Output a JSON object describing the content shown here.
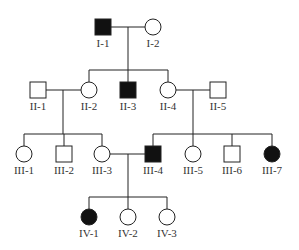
{
  "diagram": {
    "type": "pedigree",
    "colors": {
      "stroke": "#222222",
      "affected": "#111111",
      "unaffected": "#ffffff",
      "text": "#333333"
    },
    "generations": [
      "I",
      "II",
      "III",
      "IV"
    ],
    "individuals": [
      {
        "id": "I-1",
        "label": "I-1",
        "sex": "male",
        "affected": true,
        "x": 103,
        "y": 27
      },
      {
        "id": "I-2",
        "label": "I-2",
        "sex": "female",
        "affected": false,
        "x": 153,
        "y": 27
      },
      {
        "id": "II-1",
        "label": "II-1",
        "sex": "male",
        "affected": false,
        "x": 38,
        "y": 90
      },
      {
        "id": "II-2",
        "label": "II-2",
        "sex": "female",
        "affected": false,
        "x": 89,
        "y": 90
      },
      {
        "id": "II-3",
        "label": "II-3",
        "sex": "male",
        "affected": true,
        "x": 128,
        "y": 90
      },
      {
        "id": "II-4",
        "label": "II-4",
        "sex": "female",
        "affected": false,
        "x": 168,
        "y": 90
      },
      {
        "id": "II-5",
        "label": "II-5",
        "sex": "male",
        "affected": false,
        "x": 218,
        "y": 90
      },
      {
        "id": "III-1",
        "label": "III-1",
        "sex": "female",
        "affected": false,
        "x": 24,
        "y": 154
      },
      {
        "id": "III-2",
        "label": "III-2",
        "sex": "male",
        "affected": false,
        "x": 64,
        "y": 154
      },
      {
        "id": "III-3",
        "label": "III-3",
        "sex": "female",
        "affected": false,
        "x": 102,
        "y": 154
      },
      {
        "id": "III-4",
        "label": "III-4",
        "sex": "male",
        "affected": true,
        "x": 153,
        "y": 154
      },
      {
        "id": "III-5",
        "label": "III-5",
        "sex": "female",
        "affected": false,
        "x": 193,
        "y": 154
      },
      {
        "id": "III-6",
        "label": "III-6",
        "sex": "male",
        "affected": false,
        "x": 232,
        "y": 154
      },
      {
        "id": "III-7",
        "label": "III-7",
        "sex": "female",
        "affected": true,
        "x": 272,
        "y": 154
      },
      {
        "id": "IV-1",
        "label": "IV-1",
        "sex": "female",
        "affected": true,
        "x": 89,
        "y": 217
      },
      {
        "id": "IV-2",
        "label": "IV-2",
        "sex": "female",
        "affected": false,
        "x": 128,
        "y": 217
      },
      {
        "id": "IV-3",
        "label": "IV-3",
        "sex": "female",
        "affected": false,
        "x": 167,
        "y": 217
      }
    ],
    "marriages": [
      {
        "partners": [
          "I-1",
          "I-2"
        ],
        "children": [
          "II-2",
          "II-3",
          "II-4"
        ]
      },
      {
        "partners": [
          "II-1",
          "II-2"
        ],
        "children": [
          "III-1",
          "III-2",
          "III-3"
        ]
      },
      {
        "partners": [
          "II-4",
          "II-5"
        ],
        "children": [
          "III-4",
          "III-5",
          "III-6",
          "III-7"
        ]
      },
      {
        "partners": [
          "III-3",
          "III-4"
        ],
        "children": [
          "IV-1",
          "IV-2",
          "IV-3"
        ]
      }
    ]
  }
}
